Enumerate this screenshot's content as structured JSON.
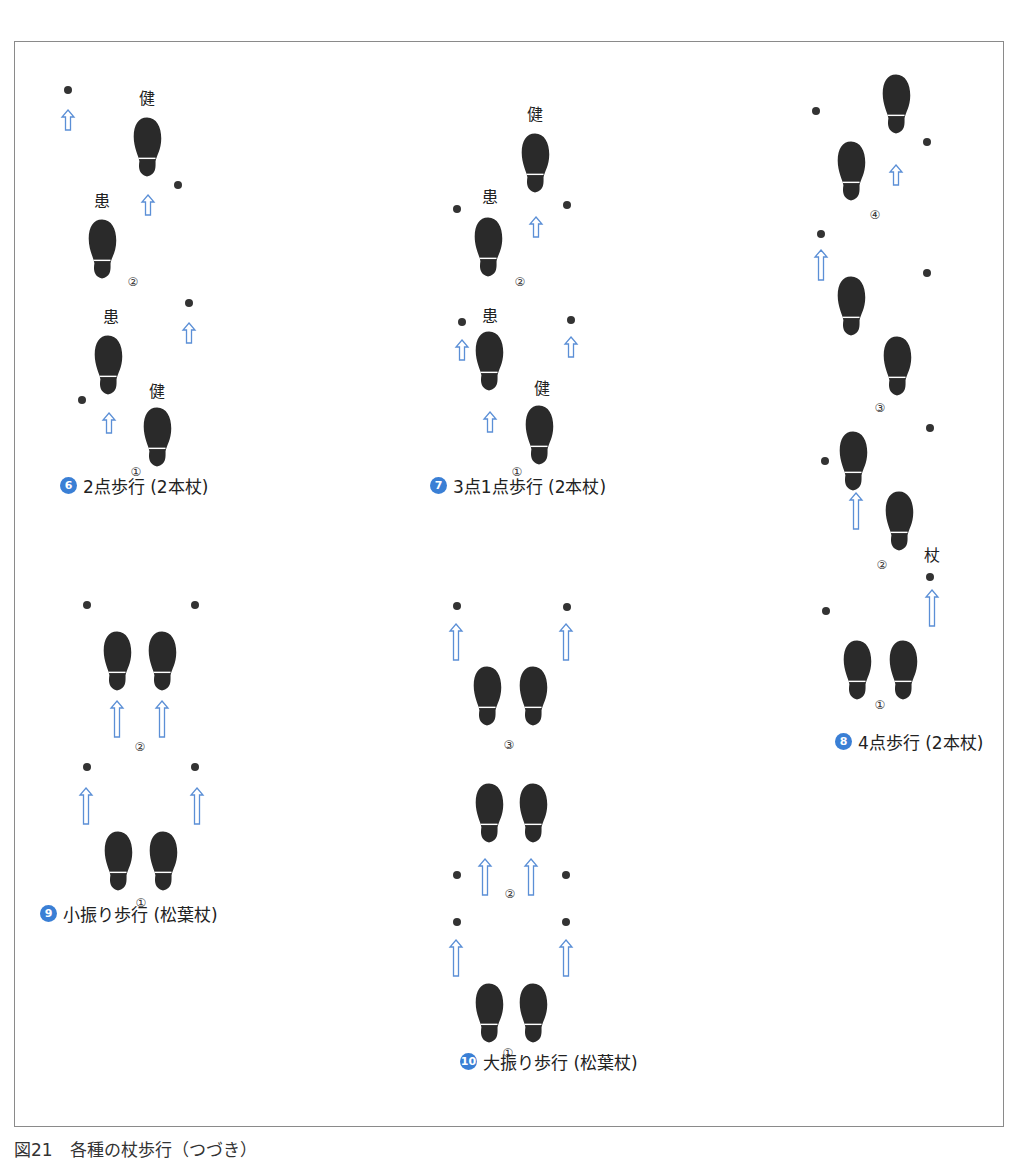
{
  "figure_caption": "図21　各種の杖歩行（つづき）",
  "colors": {
    "foot": "#2a2a2a",
    "cane_dot": "#333333",
    "arrow": "#5b8fd6",
    "badge": "#3a7fd5",
    "border": "#8a8a8a"
  },
  "panels": [
    {
      "id": "6",
      "badge": "6",
      "title": "2点歩行 (2本杖)",
      "caption_pos": [
        60,
        484
      ],
      "feet": [
        [
          147,
          146
        ],
        [
          102,
          248
        ],
        [
          108,
          364
        ],
        [
          157,
          436
        ]
      ],
      "dots": [
        [
          68,
          90
        ],
        [
          178,
          185
        ],
        [
          189,
          303
        ],
        [
          82,
          400
        ]
      ],
      "arrows": [
        [
          68,
          110,
          20
        ],
        [
          148,
          195,
          20
        ],
        [
          189,
          323,
          20
        ],
        [
          109,
          413,
          20
        ]
      ],
      "labels": [
        {
          "text": "健",
          "x": 147,
          "y": 104
        },
        {
          "text": "患",
          "x": 102,
          "y": 207
        },
        {
          "text": "患",
          "x": 111,
          "y": 323
        },
        {
          "text": "健",
          "x": 157,
          "y": 397
        }
      ],
      "steps": [
        {
          "text": "②",
          "x": 133,
          "y": 282
        },
        {
          "text": "①",
          "x": 136,
          "y": 472
        }
      ]
    },
    {
      "id": "7",
      "badge": "7",
      "title": "3点1点歩行 (2本杖)",
      "caption_pos": [
        430,
        484
      ],
      "feet": [
        [
          535,
          162
        ],
        [
          488,
          246
        ],
        [
          489,
          360
        ],
        [
          539,
          434
        ]
      ],
      "dots": [
        [
          457,
          209
        ],
        [
          567,
          205
        ],
        [
          462,
          322
        ],
        [
          571,
          320
        ]
      ],
      "arrows": [
        [
          536,
          217,
          20
        ],
        [
          462,
          340,
          20
        ],
        [
          571,
          337,
          20
        ],
        [
          490,
          412,
          20
        ]
      ],
      "labels": [
        {
          "text": "健",
          "x": 535,
          "y": 120
        },
        {
          "text": "患",
          "x": 490,
          "y": 203
        },
        {
          "text": "患",
          "x": 490,
          "y": 322
        },
        {
          "text": "健",
          "x": 542,
          "y": 394
        }
      ],
      "steps": [
        {
          "text": "②",
          "x": 520,
          "y": 282
        },
        {
          "text": "①",
          "x": 517,
          "y": 472
        }
      ]
    },
    {
      "id": "8",
      "badge": "8",
      "title": "4点歩行 (2本杖)",
      "caption_pos": [
        835,
        740
      ],
      "feet": [
        [
          896,
          103
        ],
        [
          851,
          170
        ],
        [
          851,
          305
        ],
        [
          897,
          365
        ],
        [
          853,
          460
        ],
        [
          899,
          520
        ],
        [
          857,
          669
        ],
        [
          903,
          669
        ]
      ],
      "dots": [
        [
          816,
          111
        ],
        [
          927,
          142
        ],
        [
          821,
          234
        ],
        [
          927,
          273
        ],
        [
          930,
          428
        ],
        [
          825,
          461
        ],
        [
          930,
          577
        ],
        [
          826,
          611
        ]
      ],
      "arrows": [
        [
          896,
          165,
          20
        ],
        [
          821,
          250,
          30
        ],
        [
          856,
          493,
          36
        ],
        [
          932,
          590,
          36
        ]
      ],
      "labels": [
        {
          "text": "杖",
          "x": 932,
          "y": 561
        }
      ],
      "steps": [
        {
          "text": "④",
          "x": 875,
          "y": 215
        },
        {
          "text": "③",
          "x": 880,
          "y": 408
        },
        {
          "text": "②",
          "x": 882,
          "y": 565
        },
        {
          "text": "①",
          "x": 880,
          "y": 705
        }
      ]
    },
    {
      "id": "9",
      "badge": "9",
      "title": "小振り歩行 (松葉杖)",
      "caption_pos": [
        40,
        912
      ],
      "feet": [
        [
          117,
          660
        ],
        [
          162,
          660
        ],
        [
          118,
          860
        ],
        [
          163,
          860
        ]
      ],
      "dots": [
        [
          87,
          605
        ],
        [
          195,
          605
        ],
        [
          87,
          767
        ],
        [
          195,
          767
        ]
      ],
      "arrows": [
        [
          117,
          701,
          36
        ],
        [
          162,
          701,
          36
        ],
        [
          86,
          788,
          36
        ],
        [
          197,
          788,
          36
        ]
      ],
      "labels": [],
      "steps": [
        {
          "text": "②",
          "x": 140,
          "y": 747
        },
        {
          "text": "①",
          "x": 141,
          "y": 903
        }
      ]
    },
    {
      "id": "10",
      "badge": "10",
      "title": "大振り歩行 (松葉杖)",
      "caption_pos": [
        460,
        1060
      ],
      "feet": [
        [
          487,
          695
        ],
        [
          533,
          695
        ],
        [
          489,
          812
        ],
        [
          533,
          812
        ],
        [
          489,
          1012
        ],
        [
          533,
          1012
        ]
      ],
      "dots": [
        [
          457,
          606
        ],
        [
          567,
          607
        ],
        [
          457,
          875
        ],
        [
          566,
          875
        ],
        [
          457,
          922
        ],
        [
          566,
          922
        ]
      ],
      "arrows": [
        [
          456,
          624,
          36
        ],
        [
          566,
          624,
          36
        ],
        [
          485,
          859,
          36
        ],
        [
          531,
          859,
          36
        ],
        [
          456,
          940,
          36
        ],
        [
          566,
          940,
          36
        ]
      ],
      "labels": [],
      "steps": [
        {
          "text": "③",
          "x": 509,
          "y": 745
        },
        {
          "text": "②",
          "x": 510,
          "y": 894
        },
        {
          "text": "①",
          "x": 508,
          "y": 1053
        }
      ]
    }
  ]
}
